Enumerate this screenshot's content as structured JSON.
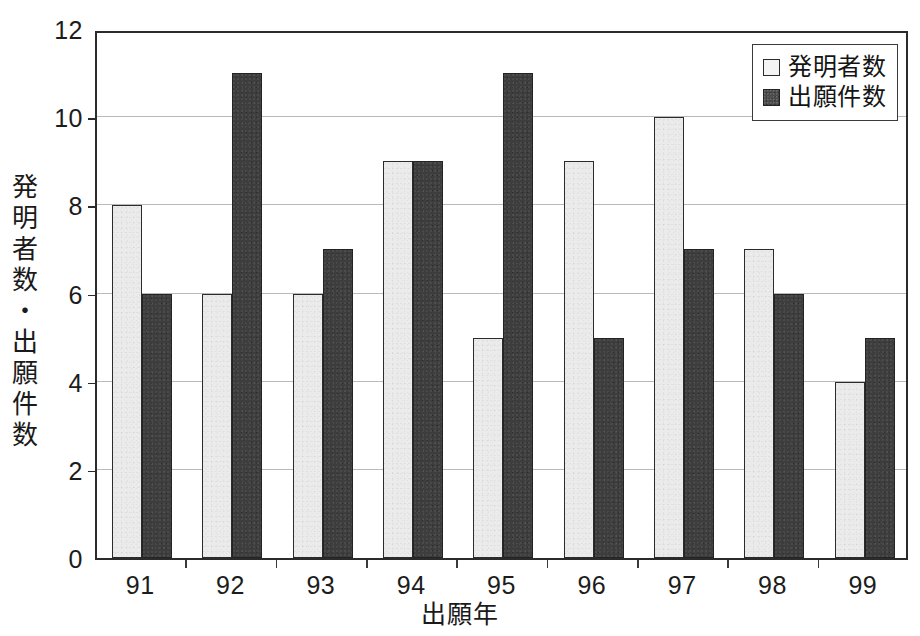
{
  "chart_data": {
    "type": "bar",
    "title": "",
    "subtitle": "",
    "xlabel": "出願年",
    "ylabel": "発明者数・出願件数",
    "categories": [
      "91",
      "92",
      "93",
      "94",
      "95",
      "96",
      "97",
      "98",
      "99"
    ],
    "series": [
      {
        "name": "発明者数",
        "values": [
          8,
          6,
          6,
          9,
          5,
          9,
          10,
          7,
          4
        ],
        "color": "#ebebeb",
        "border_color": "#2b2b2b",
        "swatch": "open-square"
      },
      {
        "name": "出願件数",
        "values": [
          6,
          11,
          7,
          9,
          11,
          5,
          7,
          6,
          5
        ],
        "color": "#3d3d3d",
        "border_color": "#232323",
        "swatch": "filled-square"
      }
    ],
    "ylim": [
      0,
      12
    ],
    "ytick_values": [
      0,
      2,
      4,
      6,
      8,
      10,
      12
    ],
    "ytick_labels": [
      "0",
      "2",
      "4",
      "6",
      "8",
      "10",
      "12"
    ],
    "grid": true,
    "grid_axis": "y",
    "grid_color": "#b9b9b9",
    "legend_position": "top-right",
    "legend_border": true,
    "frame": true,
    "frame_color": "#2b2b2b",
    "background": "#ffffff"
  },
  "axes": {
    "y_title_chars": [
      "発",
      "明",
      "者",
      "数",
      "・",
      "出",
      "願",
      "件",
      "数"
    ],
    "y_title_text": "発明者数・出願件数",
    "x_title_text": "出願年"
  },
  "legend": {
    "entries": [
      {
        "label": "発明者数",
        "style": "light"
      },
      {
        "label": "出願件数",
        "style": "dark"
      }
    ]
  }
}
